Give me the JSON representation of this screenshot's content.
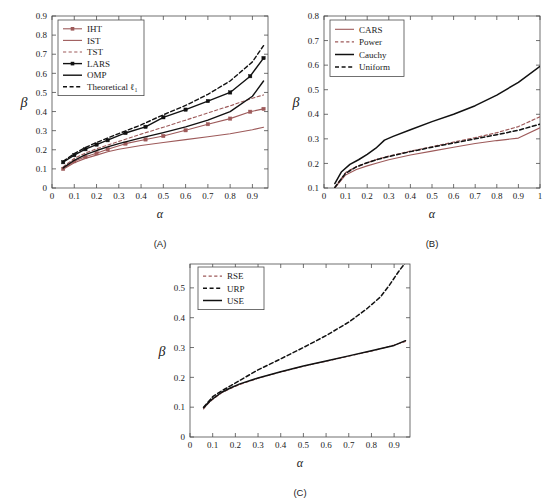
{
  "figure": {
    "background": "#ffffff",
    "colors": {
      "red": "#9d5a5a",
      "black": "#111111",
      "axis": "#4d4d4d"
    }
  },
  "chart_data": [
    {
      "id": "A",
      "type": "line",
      "title": "",
      "panel_label": "(A)",
      "xlabel": "α",
      "ylabel": "β",
      "xlim": [
        0.0,
        0.97
      ],
      "ylim": [
        0.0,
        0.9
      ],
      "xticks": [
        0,
        0.1,
        0.2,
        0.3,
        0.4,
        0.5,
        0.6,
        0.7,
        0.8,
        0.9
      ],
      "xticklabels": [
        "0",
        "0.1",
        "0.2",
        "0.3",
        "0.4",
        "0.5",
        "0.6",
        "0.7",
        "0.8",
        "0.9"
      ],
      "yticks": [
        0,
        0.1,
        0.2,
        0.3,
        0.4,
        0.5,
        0.6,
        0.7,
        0.8,
        0.9
      ],
      "yticklabels": [
        "0",
        "0.1",
        "0.2",
        "0.3",
        "0.4",
        "0.5",
        "0.6",
        "0.7",
        "0.8",
        "0.9"
      ],
      "grid": false,
      "legend_position": "upper left",
      "series": [
        {
          "name": "IHT",
          "color": "#9d5a5a",
          "style": "solid",
          "width": 1.1,
          "markers": true,
          "x": [
            0.05,
            0.1,
            0.15,
            0.2,
            0.25,
            0.33,
            0.42,
            0.5,
            0.6,
            0.7,
            0.8,
            0.89,
            0.95
          ],
          "y": [
            0.1,
            0.14,
            0.163,
            0.182,
            0.203,
            0.232,
            0.254,
            0.272,
            0.302,
            0.334,
            0.363,
            0.399,
            0.414
          ]
        },
        {
          "name": "IST",
          "color": "#9d5a5a",
          "style": "solid",
          "width": 1.1,
          "markers": false,
          "x": [
            0.05,
            0.1,
            0.15,
            0.2,
            0.25,
            0.3,
            0.4,
            0.5,
            0.6,
            0.7,
            0.8,
            0.9,
            0.95
          ],
          "y": [
            0.098,
            0.132,
            0.155,
            0.172,
            0.19,
            0.203,
            0.222,
            0.238,
            0.253,
            0.268,
            0.284,
            0.305,
            0.318
          ]
        },
        {
          "name": "TST",
          "color": "#9d5a5a",
          "style": "dashed",
          "width": 1.1,
          "markers": false,
          "x": [
            0.05,
            0.1,
            0.15,
            0.2,
            0.25,
            0.3,
            0.4,
            0.5,
            0.6,
            0.7,
            0.8,
            0.9,
            0.95
          ],
          "y": [
            0.11,
            0.155,
            0.183,
            0.205,
            0.225,
            0.244,
            0.282,
            0.318,
            0.355,
            0.393,
            0.43,
            0.47,
            0.487
          ]
        },
        {
          "name": "LARS",
          "color": "#111111",
          "style": "solid",
          "width": 1.4,
          "markers": true,
          "x": [
            0.05,
            0.1,
            0.15,
            0.2,
            0.25,
            0.33,
            0.42,
            0.5,
            0.6,
            0.7,
            0.8,
            0.89,
            0.95
          ],
          "y": [
            0.135,
            0.172,
            0.203,
            0.227,
            0.25,
            0.288,
            0.32,
            0.37,
            0.41,
            0.455,
            0.5,
            0.585,
            0.68
          ]
        },
        {
          "name": "OMP",
          "color": "#111111",
          "style": "solid",
          "width": 1.4,
          "markers": false,
          "x": [
            0.05,
            0.1,
            0.15,
            0.2,
            0.25,
            0.3,
            0.4,
            0.5,
            0.6,
            0.7,
            0.8,
            0.9,
            0.95
          ],
          "y": [
            0.105,
            0.145,
            0.175,
            0.196,
            0.215,
            0.232,
            0.262,
            0.29,
            0.32,
            0.355,
            0.4,
            0.48,
            0.56
          ]
        },
        {
          "name": "Theoretical ℓ₁",
          "color": "#111111",
          "style": "dashed",
          "width": 1.4,
          "markers": false,
          "x": [
            0.05,
            0.1,
            0.15,
            0.2,
            0.25,
            0.3,
            0.4,
            0.5,
            0.6,
            0.7,
            0.8,
            0.9,
            0.95
          ],
          "y": [
            0.14,
            0.18,
            0.212,
            0.238,
            0.262,
            0.285,
            0.33,
            0.383,
            0.432,
            0.49,
            0.56,
            0.66,
            0.745
          ]
        }
      ]
    },
    {
      "id": "B",
      "type": "line",
      "title": "",
      "panel_label": "(B)",
      "xlabel": "α",
      "ylabel": "β",
      "xlim": [
        0.0,
        1.0
      ],
      "ylim": [
        0.1,
        0.8
      ],
      "xticks": [
        0,
        0.1,
        0.2,
        0.3,
        0.4,
        0.5,
        0.6,
        0.7,
        0.8,
        0.9,
        1.0
      ],
      "xticklabels": [
        "0",
        "0.1",
        "0.2",
        "0.3",
        "0.4",
        "0.5",
        "0.6",
        "0.7",
        "0.8",
        "0.9",
        "1"
      ],
      "yticks": [
        0.1,
        0.2,
        0.3,
        0.4,
        0.5,
        0.6,
        0.7,
        0.8
      ],
      "yticklabels": [
        "0.1",
        "0.2",
        "0.3",
        "0.4",
        "0.5",
        "0.6",
        "0.7",
        "0.8"
      ],
      "grid": false,
      "legend_position": "upper left",
      "series": [
        {
          "name": "CARS",
          "color": "#9d5a5a",
          "style": "solid",
          "width": 1.1,
          "markers": false,
          "x": [
            0.05,
            0.1,
            0.15,
            0.2,
            0.25,
            0.3,
            0.4,
            0.5,
            0.6,
            0.7,
            0.8,
            0.9,
            1.0
          ],
          "y": [
            0.1,
            0.153,
            0.175,
            0.19,
            0.203,
            0.215,
            0.234,
            0.25,
            0.266,
            0.281,
            0.293,
            0.303,
            0.345
          ]
        },
        {
          "name": "Power",
          "color": "#9d5a5a",
          "style": "dashed",
          "width": 1.2,
          "markers": false,
          "x": [
            0.05,
            0.1,
            0.15,
            0.2,
            0.25,
            0.3,
            0.4,
            0.5,
            0.6,
            0.7,
            0.8,
            0.9,
            1.0
          ],
          "y": [
            0.102,
            0.163,
            0.187,
            0.203,
            0.218,
            0.23,
            0.25,
            0.268,
            0.287,
            0.305,
            0.325,
            0.35,
            0.39
          ]
        },
        {
          "name": "Cauchy",
          "color": "#111111",
          "style": "solid",
          "width": 1.5,
          "markers": false,
          "x": [
            0.05,
            0.08,
            0.12,
            0.16,
            0.2,
            0.24,
            0.28,
            0.32,
            0.4,
            0.5,
            0.6,
            0.7,
            0.8,
            0.9,
            1.0
          ],
          "y": [
            0.118,
            0.165,
            0.196,
            0.215,
            0.237,
            0.262,
            0.295,
            0.31,
            0.337,
            0.37,
            0.4,
            0.435,
            0.478,
            0.53,
            0.595
          ]
        },
        {
          "name": "Uniform",
          "color": "#111111",
          "style": "dashed",
          "width": 1.5,
          "markers": false,
          "x": [
            0.05,
            0.1,
            0.15,
            0.2,
            0.25,
            0.3,
            0.4,
            0.5,
            0.6,
            0.7,
            0.8,
            0.9,
            1.0
          ],
          "y": [
            0.102,
            0.16,
            0.186,
            0.203,
            0.217,
            0.228,
            0.248,
            0.266,
            0.283,
            0.3,
            0.317,
            0.335,
            0.36
          ]
        }
      ]
    },
    {
      "id": "C",
      "type": "line",
      "title": "",
      "panel_label": "(C)",
      "xlabel": "α",
      "ylabel": "β",
      "xlim": [
        0.0,
        0.97
      ],
      "ylim": [
        0.0,
        0.58
      ],
      "xticks": [
        0,
        0.1,
        0.2,
        0.3,
        0.4,
        0.5,
        0.6,
        0.7,
        0.8,
        0.9
      ],
      "xticklabels": [
        "0",
        "0.1",
        "0.2",
        "0.3",
        "0.4",
        "0.5",
        "0.6",
        "0.7",
        "0.8",
        "0.9"
      ],
      "yticks": [
        0,
        0.1,
        0.2,
        0.3,
        0.4,
        0.5
      ],
      "yticklabels": [
        "0",
        "0.1",
        "0.2",
        "0.3",
        "0.4",
        "0.5"
      ],
      "grid": false,
      "legend_position": "upper left",
      "series": [
        {
          "name": "RSE",
          "color": "#9d5a5a",
          "style": "dashed",
          "width": 1.1,
          "markers": false,
          "x": [
            0.06,
            0.08,
            0.1,
            0.14,
            0.18,
            0.22,
            0.3,
            0.4,
            0.5,
            0.6,
            0.7,
            0.8,
            0.9,
            0.95
          ],
          "y": [
            0.094,
            0.112,
            0.126,
            0.148,
            0.163,
            0.176,
            0.197,
            0.218,
            0.237,
            0.254,
            0.271,
            0.288,
            0.308,
            0.32
          ]
        },
        {
          "name": "URP",
          "color": "#111111",
          "style": "dashed",
          "width": 1.5,
          "markers": false,
          "x": [
            0.06,
            0.1,
            0.14,
            0.18,
            0.22,
            0.3,
            0.4,
            0.5,
            0.6,
            0.7,
            0.78,
            0.84,
            0.88,
            0.92,
            0.95
          ],
          "y": [
            0.1,
            0.135,
            0.155,
            0.172,
            0.19,
            0.225,
            0.262,
            0.3,
            0.34,
            0.385,
            0.43,
            0.47,
            0.51,
            0.555,
            0.585
          ]
        },
        {
          "name": "USE",
          "color": "#111111",
          "style": "solid",
          "width": 1.5,
          "markers": false,
          "x": [
            0.06,
            0.08,
            0.1,
            0.14,
            0.18,
            0.22,
            0.3,
            0.4,
            0.5,
            0.6,
            0.7,
            0.8,
            0.9,
            0.95
          ],
          "y": [
            0.098,
            0.114,
            0.128,
            0.15,
            0.165,
            0.178,
            0.198,
            0.219,
            0.238,
            0.255,
            0.272,
            0.289,
            0.307,
            0.323
          ]
        }
      ]
    }
  ]
}
